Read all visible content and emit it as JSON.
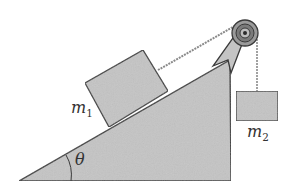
{
  "diagram": {
    "type": "physics-incline-pulley",
    "labels": {
      "mass1": {
        "symbol": "m",
        "subscript": "1"
      },
      "mass2": {
        "symbol": "m",
        "subscript": "2"
      },
      "angle": "θ"
    },
    "colors": {
      "fill": "#c4c4c4",
      "stroke": "#3a3a3a",
      "rope": "#8a8a8a",
      "background": "#ffffff"
    }
  }
}
